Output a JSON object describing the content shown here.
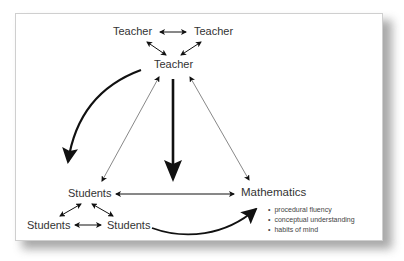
{
  "diagram": {
    "nodes": {
      "teacher_left": "Teacher",
      "teacher_right": "Teacher",
      "teacher_center": "Teacher",
      "students_top": "Students",
      "students_left": "Students",
      "students_right": "Students",
      "mathematics": "Mathematics"
    },
    "mathematics_bullets": [
      "procedural fluency",
      "conceptual understanding",
      "habits of mind"
    ],
    "edges": [
      {
        "from": "teacher_left",
        "to": "teacher_right",
        "type": "double-thin"
      },
      {
        "from": "teacher_left",
        "to": "teacher_center",
        "type": "double-thin"
      },
      {
        "from": "teacher_right",
        "to": "teacher_center",
        "type": "double-thin"
      },
      {
        "from": "teacher_center",
        "to": "students_top",
        "type": "curved-bold"
      },
      {
        "from": "teacher_center",
        "to": "students_top",
        "type": "double-hairline"
      },
      {
        "from": "teacher_center",
        "to": "center",
        "type": "straight-bold"
      },
      {
        "from": "teacher_center",
        "to": "mathematics",
        "type": "double-hairline"
      },
      {
        "from": "students_top",
        "to": "mathematics",
        "type": "double-thin"
      },
      {
        "from": "students_top",
        "to": "students_left",
        "type": "double-thin"
      },
      {
        "from": "students_top",
        "to": "students_right",
        "type": "double-thin"
      },
      {
        "from": "students_left",
        "to": "students_right",
        "type": "double-thin"
      },
      {
        "from": "students_right",
        "to": "mathematics",
        "type": "curved-bold"
      }
    ],
    "colors": {
      "text": "#333333",
      "arrow": "#111111",
      "frame_border": "#cfcfcf",
      "shadow": "#9a9a9a"
    }
  }
}
